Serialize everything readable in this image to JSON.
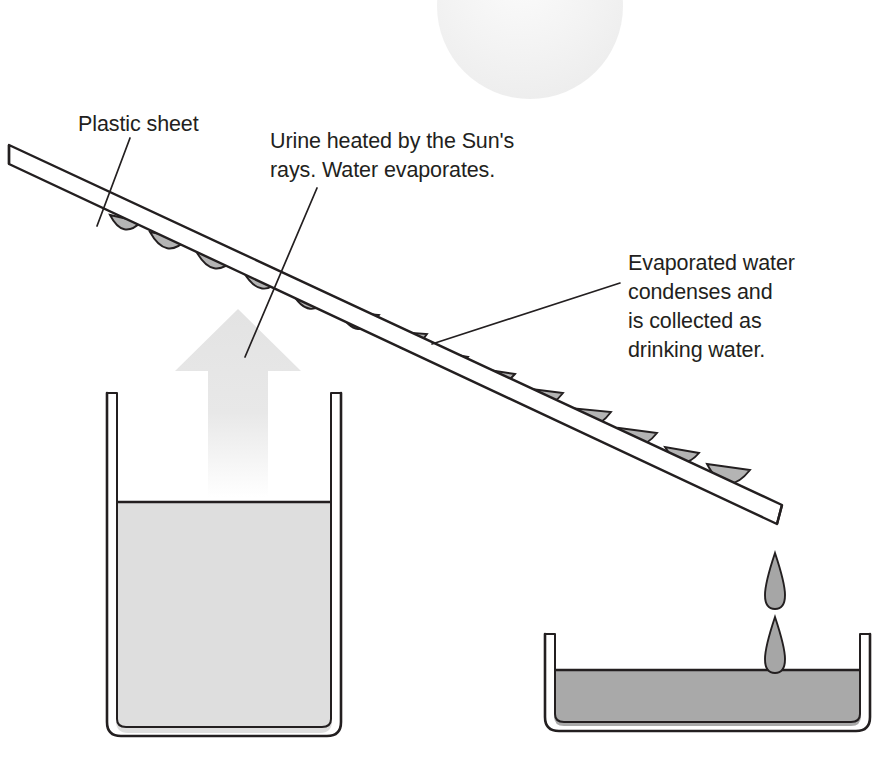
{
  "diagram": {
    "background_color": "#ffffff",
    "width": 890,
    "height": 757,
    "labels": {
      "plastic_sheet": "Plastic sheet",
      "urine_heated": "Urine heated by the Sun's\nrays. Water evaporates.",
      "evaporated_water": "Evaporated water\ncondenses and\nis collected as\ndrinking water."
    },
    "elements": {
      "sun": {
        "name": "sun",
        "fill": "#f0f0f0",
        "cx": 530,
        "cy": 6,
        "r": 93
      },
      "vapor_arrow": {
        "name": "rising-vapor-arrow",
        "fill": "#e6e6e6"
      },
      "plastic_sheet": {
        "name": "plastic-sheet",
        "fill": "#ffffff",
        "stroke": "#231f20"
      },
      "condensation_droplets": {
        "name": "condensation-droplets",
        "fill": "#b0b0b0",
        "stroke": "#231f20",
        "count": 14
      },
      "falling_drops": {
        "name": "falling-drops",
        "fill": "#a6a6a6",
        "stroke": "#231f20",
        "count": 2
      },
      "urine_container": {
        "name": "urine-container",
        "liquid_label": "urine",
        "liquid_fill": "#dedede",
        "stroke": "#231f20"
      },
      "water_tray": {
        "name": "drinking-water-tray",
        "liquid_label": "drinking water",
        "liquid_fill": "#a9a9a9",
        "stroke": "#231f20"
      }
    },
    "colors": {
      "outline": "#231f20",
      "text": "#231f20",
      "light_gray": "#e6e6e6",
      "mid_gray": "#b0b0b0",
      "dark_gray": "#a9a9a9"
    }
  }
}
